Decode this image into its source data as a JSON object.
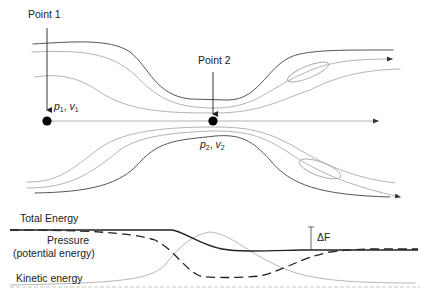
{
  "diagram": {
    "points": [
      {
        "label": "Point 1",
        "var_p": "p",
        "var_v": "v",
        "sub": "1"
      },
      {
        "label": "Point 2",
        "var_p": "p",
        "var_v": "v",
        "sub": "2"
      }
    ],
    "separator": ", ",
    "energy": {
      "total_label": "Total Energy",
      "pressure_label": "Pressure",
      "pressure_sublabel": "(potential energy)",
      "kinetic_label": "Kinetic energy",
      "loss_label": "ΔF"
    },
    "colors": {
      "outer_streamline": "#555555",
      "inner_streamline": "#aaaaaa",
      "total_energy": "#222222",
      "pressure": "#222222",
      "kinetic": "#b0b0b0",
      "baseline": "#bbbbbb"
    }
  }
}
